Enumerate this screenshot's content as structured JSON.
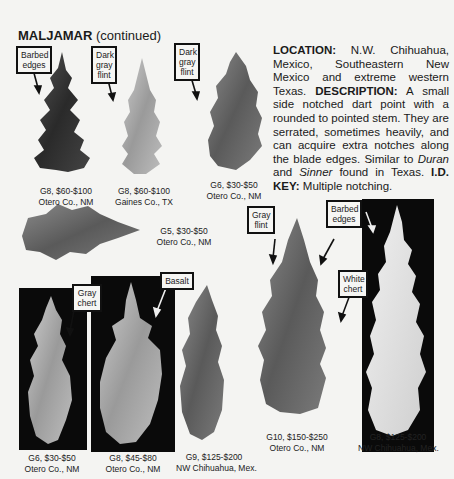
{
  "page": {
    "title_bold": "MALJAMAR",
    "title_rest": " (continued)"
  },
  "description": {
    "location_label": "LOCATION:",
    "location_text": " N.W. Chihuahua, Mexico, Southeastern New Mexico and extreme western Texas. ",
    "description_label": "DESCRIPTION:",
    "description_text": " A small side notched dart point with a rounded to pointed stem. They are serrated, sometimes heavily, and can acquire extra notches along the blade edges. Similar to ",
    "similar_1": "Duran",
    "and_text": " and ",
    "similar_2": "Sinner",
    "found_text": " found in Texas. ",
    "idkey_label": "I.D. KEY:",
    "idkey_text": " Multiple notching."
  },
  "callouts": {
    "c1": "Barbed edges",
    "c2": "Dark gray flint",
    "c3": "Dark gray flint",
    "c4": "Gray flint",
    "c5": "Barbed edges",
    "c6": "White chert",
    "c7": "Gray chert",
    "c8": "Basalt"
  },
  "specimens": [
    {
      "grade_price": "G8, $60-$100",
      "location": "Otero Co., NM"
    },
    {
      "grade_price": "G8, $60-$100",
      "location": "Gaines Co., TX"
    },
    {
      "grade_price": "G6, $30-$50",
      "location": "Otero Co., NM"
    },
    {
      "grade_price": "G5, $30-$50",
      "location": "Otero Co., NM"
    },
    {
      "grade_price": "G6, $30-$50",
      "location": "Otero Co., NM"
    },
    {
      "grade_price": "G8, $45-$80",
      "location": "Otero Co., NM"
    },
    {
      "grade_price": "G9, $125-$200",
      "location": "NW Chihuahua, Mex."
    },
    {
      "grade_price": "G10, $150-$250",
      "location": "Otero Co., NM"
    },
    {
      "grade_price": "G8, $125-$200",
      "location": "NW Chihuahua, Mex."
    }
  ]
}
